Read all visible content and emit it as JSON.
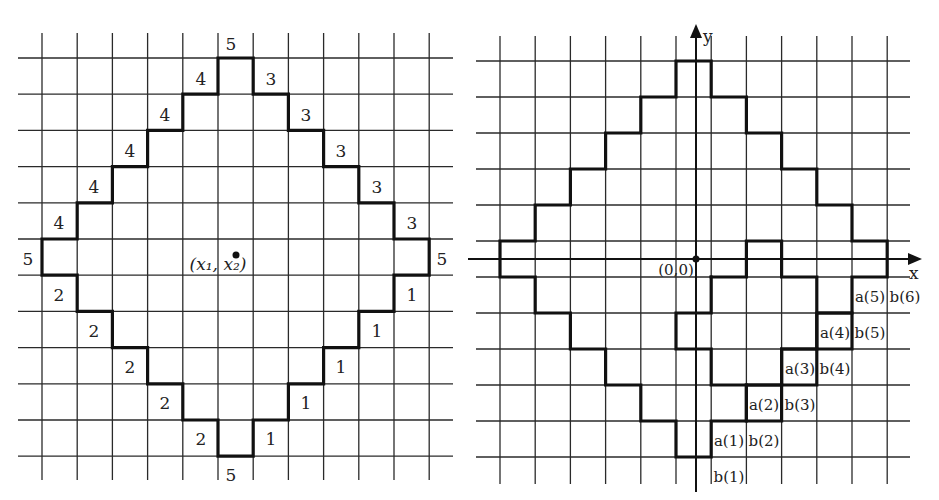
{
  "figure": {
    "left_panel": {
      "grid": {
        "x0": 42,
        "dx": 35.2,
        "cols": 12,
        "y0": 58,
        "dy": 36.2,
        "rows": 12,
        "hx_start": 18,
        "hx_end": 453,
        "vy_start": 33,
        "vy_end": 480
      },
      "outline": [
        [
          5,
          0
        ],
        [
          5,
          1
        ],
        [
          4,
          1
        ],
        [
          4,
          2
        ],
        [
          3,
          2
        ],
        [
          3,
          3
        ],
        [
          2,
          3
        ],
        [
          2,
          4
        ],
        [
          1,
          4
        ],
        [
          1,
          5
        ],
        [
          0,
          5
        ],
        [
          0,
          6
        ],
        [
          1,
          6
        ],
        [
          1,
          7
        ],
        [
          2,
          7
        ],
        [
          2,
          8
        ],
        [
          3,
          8
        ],
        [
          3,
          9
        ],
        [
          4,
          9
        ],
        [
          4,
          10
        ],
        [
          5,
          10
        ],
        [
          5,
          11
        ],
        [
          6,
          11
        ],
        [
          6,
          10
        ],
        [
          7,
          10
        ],
        [
          7,
          9
        ],
        [
          8,
          9
        ],
        [
          8,
          8
        ],
        [
          9,
          8
        ],
        [
          9,
          7
        ],
        [
          10,
          7
        ],
        [
          10,
          6
        ],
        [
          11,
          6
        ],
        [
          11,
          5
        ],
        [
          10,
          5
        ],
        [
          10,
          4
        ],
        [
          9,
          4
        ],
        [
          9,
          3
        ],
        [
          8,
          3
        ],
        [
          8,
          2
        ],
        [
          7,
          2
        ],
        [
          7,
          1
        ],
        [
          6,
          1
        ],
        [
          6,
          0
        ],
        [
          5,
          0
        ]
      ],
      "edge_labels": [
        {
          "text": "5",
          "x": 231,
          "y": 50
        },
        {
          "text": "4",
          "x": 201,
          "y": 85
        },
        {
          "text": "4",
          "x": 165,
          "y": 121
        },
        {
          "text": "4",
          "x": 130,
          "y": 157
        },
        {
          "text": "4",
          "x": 94,
          "y": 193
        },
        {
          "text": "4",
          "x": 59,
          "y": 229
        },
        {
          "text": "5",
          "x": 28,
          "y": 265
        },
        {
          "text": "2",
          "x": 59,
          "y": 301
        },
        {
          "text": "2",
          "x": 94,
          "y": 337
        },
        {
          "text": "2",
          "x": 130,
          "y": 373
        },
        {
          "text": "2",
          "x": 165,
          "y": 409
        },
        {
          "text": "2",
          "x": 201,
          "y": 445
        },
        {
          "text": "5",
          "x": 231,
          "y": 481
        },
        {
          "text": "3",
          "x": 271,
          "y": 85
        },
        {
          "text": "3",
          "x": 306,
          "y": 121
        },
        {
          "text": "3",
          "x": 341,
          "y": 157
        },
        {
          "text": "3",
          "x": 377,
          "y": 193
        },
        {
          "text": "3",
          "x": 412,
          "y": 229
        },
        {
          "text": "5",
          "x": 442,
          "y": 265
        },
        {
          "text": "1",
          "x": 412,
          "y": 301
        },
        {
          "text": "1",
          "x": 377,
          "y": 337
        },
        {
          "text": "1",
          "x": 341,
          "y": 373
        },
        {
          "text": "1",
          "x": 306,
          "y": 409
        },
        {
          "text": "1",
          "x": 271,
          "y": 445
        }
      ],
      "center_point": {
        "x": 236,
        "y": 255,
        "label": "(x₁, x₂)",
        "label_x": 218,
        "label_y": 270
      }
    },
    "right_panel": {
      "grid": {
        "x0": 500,
        "dx": 35.2,
        "cols": 12,
        "y0": 61,
        "dy": 36.0,
        "rows": 12,
        "hx_start": 476,
        "hx_end": 910,
        "vy_start": 36,
        "vy_end": 484
      },
      "outline": [
        [
          5,
          0
        ],
        [
          5,
          1
        ],
        [
          4,
          1
        ],
        [
          4,
          2
        ],
        [
          3,
          2
        ],
        [
          3,
          3
        ],
        [
          2,
          3
        ],
        [
          2,
          4
        ],
        [
          1,
          4
        ],
        [
          1,
          5
        ],
        [
          0,
          5
        ],
        [
          0,
          6
        ],
        [
          1,
          6
        ],
        [
          1,
          7
        ],
        [
          2,
          7
        ],
        [
          2,
          8
        ],
        [
          3,
          8
        ],
        [
          3,
          9
        ],
        [
          4,
          9
        ],
        [
          4,
          10
        ],
        [
          5,
          10
        ],
        [
          5,
          11
        ],
        [
          6,
          11
        ],
        [
          6,
          10
        ],
        [
          7,
          10
        ],
        [
          7,
          9
        ],
        [
          8,
          9
        ],
        [
          8,
          8
        ],
        [
          9,
          8
        ],
        [
          9,
          7
        ],
        [
          10,
          7
        ],
        [
          10,
          6
        ],
        [
          11,
          6
        ],
        [
          11,
          5
        ],
        [
          10,
          5
        ],
        [
          10,
          4
        ],
        [
          9,
          4
        ],
        [
          9,
          3
        ],
        [
          8,
          3
        ],
        [
          8,
          2
        ],
        [
          7,
          2
        ],
        [
          7,
          1
        ],
        [
          6,
          1
        ],
        [
          6,
          0
        ],
        [
          5,
          0
        ]
      ],
      "inner_segments": [
        [
          [
            6,
            6
          ],
          [
            7,
            6
          ],
          [
            7,
            5
          ],
          [
            8,
            5
          ],
          [
            8,
            6
          ],
          [
            9,
            6
          ],
          [
            9,
            8
          ],
          [
            10,
            8
          ],
          [
            10,
            7
          ],
          [
            9,
            7
          ]
        ],
        [
          [
            6,
            6
          ],
          [
            6,
            7
          ],
          [
            5,
            7
          ],
          [
            5,
            8
          ],
          [
            6,
            8
          ],
          [
            6,
            9
          ],
          [
            9,
            9
          ],
          [
            9,
            8
          ],
          [
            8,
            8
          ],
          [
            8,
            9
          ]
        ],
        [
          [
            7,
            9
          ],
          [
            7,
            10
          ],
          [
            8,
            10
          ],
          [
            8,
            9
          ]
        ]
      ],
      "axes": {
        "origin_x": 696,
        "origin_y": 259,
        "x_axis_start": 468,
        "x_axis_end": 922,
        "y_axis_top": 24,
        "y_axis_bottom": 492,
        "x_label": "x",
        "y_label": "y",
        "origin_label": "(0,0)"
      },
      "cell_labels": [
        {
          "text": "a(1)",
          "x": 729,
          "y": 446
        },
        {
          "text": "b(2)",
          "x": 764,
          "y": 446
        },
        {
          "text": "b(1)",
          "x": 729,
          "y": 482
        },
        {
          "text": "a(2)",
          "x": 764,
          "y": 410
        },
        {
          "text": "b(3)",
          "x": 800,
          "y": 410
        },
        {
          "text": "a(3)",
          "x": 800,
          "y": 374
        },
        {
          "text": "b(4)",
          "x": 835,
          "y": 374
        },
        {
          "text": "a(4)",
          "x": 835,
          "y": 338
        },
        {
          "text": "b(5)",
          "x": 870,
          "y": 338
        },
        {
          "text": "a(5)",
          "x": 870,
          "y": 302
        },
        {
          "text": "b(6)",
          "x": 905,
          "y": 302
        }
      ]
    }
  }
}
